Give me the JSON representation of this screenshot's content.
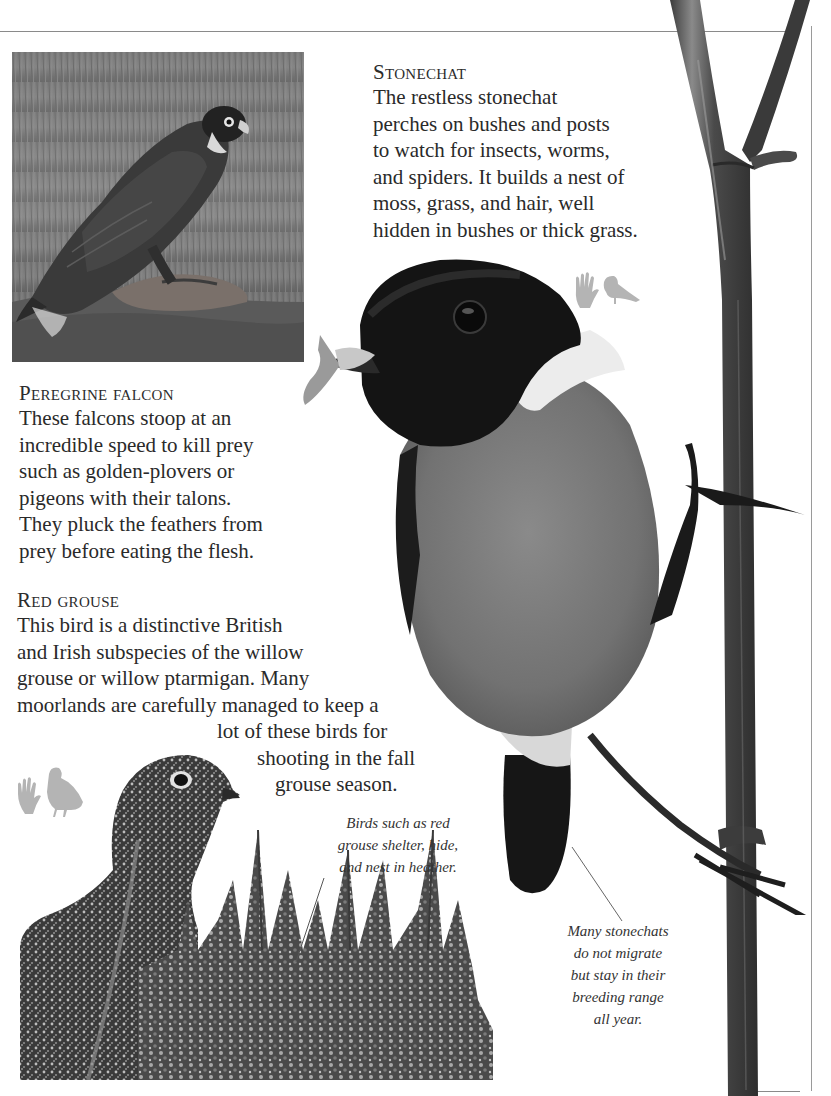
{
  "page": {
    "sections": {
      "stonechat": {
        "heading": "Stonechat",
        "lines": [
          "The restless stonechat",
          "perches on bushes and posts",
          "to watch for insects, worms,",
          "and spiders. It builds a nest of",
          "moss, grass, and hair, well",
          "hidden in bushes or thick grass."
        ]
      },
      "peregrine_falcon": {
        "heading": "Peregrine falcon",
        "lines": [
          "These falcons stoop at an",
          "incredible speed to kill prey",
          "such as golden-plovers or",
          "pigeons with their talons.",
          "They pluck the feathers from",
          "prey before eating the flesh."
        ]
      },
      "red_grouse": {
        "heading": "Red grouse",
        "lines": [
          "This bird is a distinctive British",
          "and Irish subspecies of the willow",
          "grouse or willow ptarmigan. Many",
          "moorlands are carefully managed to keep a",
          "lot of these birds for",
          "shooting in the fall",
          "grouse season."
        ]
      }
    },
    "captions": {
      "grouse_heather": {
        "lines": [
          "Birds such as red",
          "grouse shelter, hide,",
          "and nest in heather."
        ]
      },
      "stonechat_migrate": {
        "lines": [
          "Many stonechats",
          "do not migrate",
          "but stay in their",
          "breeding range",
          "all year."
        ]
      }
    },
    "images": {
      "falcon_photo": "peregrine-falcon-photo",
      "stonechat_photo": "stonechat-on-stem-photo",
      "grouse_photo": "red-grouse-in-heather-photo"
    },
    "icons": {
      "stonechat_scale": "hand-and-small-bird-scale-icon",
      "grouse_scale": "hand-and-grouse-scale-icon"
    },
    "colors": {
      "text": "#2a2a2a",
      "silhouette": "#b4b4b4",
      "rule": "#8a8a8a"
    }
  }
}
